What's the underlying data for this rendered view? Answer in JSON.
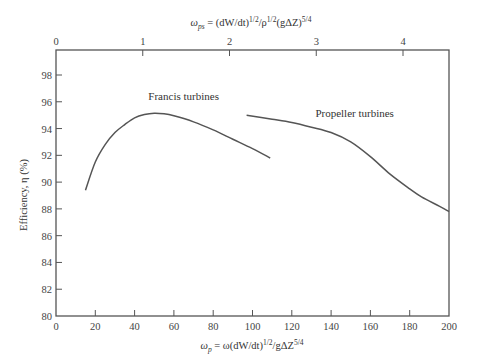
{
  "chart_data": {
    "type": "line",
    "title": "",
    "xlabel": "ωp = ω(dW/dt)^1/2 / gΔZ^5/4",
    "xlabel_parts": {
      "main": "ω",
      "sub": "p",
      "rest": " = ω(dW/dt)",
      "sup1": "1/2",
      "rest2": "/gΔZ",
      "sup2": "5/4"
    },
    "x2label": "ωps = (dW/dt)^1/2 / ρ^1/2 (gΔZ)^5/4",
    "x2label_parts": {
      "main": "ω",
      "sub": "ps",
      "rest": " = (dW/dt)",
      "sup1": "1/2",
      "rest2": "/ρ",
      "sup2": "1/2",
      "rest3": "(gΔZ)",
      "sup3": "5/4"
    },
    "ylabel": "Efficiency, η (%)",
    "xlim": [
      0,
      200
    ],
    "ylim": [
      80,
      100
    ],
    "x2lim": [
      0,
      4.47
    ],
    "xticks": [
      0,
      20,
      40,
      60,
      80,
      100,
      120,
      140,
      160,
      180,
      200
    ],
    "yticks": [
      80,
      82,
      84,
      86,
      88,
      90,
      92,
      94,
      96,
      98
    ],
    "x2ticks": [
      0,
      1,
      2,
      3,
      4
    ],
    "grid": false,
    "legend": null,
    "series": [
      {
        "name": "Francis turbines",
        "x": [
          15,
          20,
          25,
          30,
          35,
          40,
          45,
          50,
          55,
          60,
          70,
          80,
          90,
          100,
          109
        ],
        "y": [
          89.4,
          91.5,
          92.8,
          93.7,
          94.3,
          94.8,
          95.05,
          95.15,
          95.1,
          94.95,
          94.5,
          93.9,
          93.2,
          92.5,
          91.8
        ]
      },
      {
        "name": "Propeller turbines",
        "x": [
          97,
          110,
          120,
          130,
          140,
          150,
          160,
          170,
          180,
          186,
          195,
          200
        ],
        "y": [
          95.0,
          94.7,
          94.45,
          94.1,
          93.7,
          93.0,
          91.9,
          90.6,
          89.5,
          88.9,
          88.2,
          87.8
        ]
      }
    ],
    "annotations": [
      {
        "text": "Francis turbines",
        "x": 47,
        "y": 96.1
      },
      {
        "text": "Propeller turbines",
        "x": 132,
        "y": 94.9
      }
    ]
  },
  "colors": {
    "curve": "#555555",
    "axis": "#555555"
  }
}
